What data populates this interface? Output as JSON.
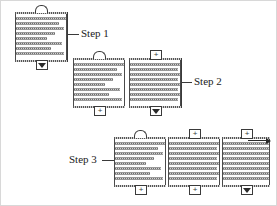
{
  "diagram": {
    "steps": [
      {
        "id": "step1",
        "label": "Step 1",
        "units": 1
      },
      {
        "id": "step2",
        "label": "Step 2",
        "units": 2
      },
      {
        "id": "step3",
        "label": "Step 3",
        "units": 3
      }
    ],
    "glyph_names": {
      "arch": "arch-connector-icon",
      "boxplus": "plus-connector-icon",
      "triangle": "triangle-terminator-icon"
    },
    "glyph_text": {
      "plus": "+",
      "arch": "",
      "triangle": ""
    },
    "colors": {
      "line": "#4a4a4a",
      "bar_dark": "#6e6e6e",
      "bar_light": "#d5d5d5",
      "text": "#1b1b1b",
      "background": "#ffffff",
      "frame": "#d8d8d8"
    },
    "units": [
      {
        "id": "s1-u1",
        "step": "Step 1",
        "position": {
          "x": 14,
          "y": 11,
          "w": 52,
          "h": 50
        },
        "top_glyph": "arch",
        "bottom_glyph": "triangle",
        "bar_lengths": [
          100,
          86,
          96,
          78,
          62,
          92,
          70,
          96,
          84
        ]
      },
      {
        "id": "s2-u1",
        "step": "Step 2",
        "position": {
          "x": 72,
          "y": 57,
          "w": 52,
          "h": 50
        },
        "top_glyph": "arch",
        "bottom_glyph": "boxplus",
        "bar_lengths": [
          100,
          86,
          96,
          78,
          62,
          92,
          70,
          96,
          84
        ]
      },
      {
        "id": "s2-u2",
        "step": "Step 2",
        "position": {
          "x": 128,
          "y": 57,
          "w": 52,
          "h": 50
        },
        "top_glyph": "boxplus",
        "bottom_glyph": "triangle",
        "bar_lengths": [
          100,
          96,
          100,
          96,
          100,
          96,
          100,
          96,
          100
        ]
      },
      {
        "id": "s3-u1",
        "step": "Step 3",
        "position": {
          "x": 113,
          "y": 136,
          "w": 52,
          "h": 50
        },
        "top_glyph": "arch",
        "bottom_glyph": "boxplus",
        "bar_lengths": [
          100,
          86,
          96,
          78,
          62,
          92,
          70,
          96,
          84
        ]
      },
      {
        "id": "s3-u2",
        "step": "Step 3",
        "position": {
          "x": 167,
          "y": 136,
          "w": 52,
          "h": 50
        },
        "top_glyph": "boxplus",
        "bottom_glyph": "boxplus",
        "bar_lengths": [
          100,
          96,
          100,
          96,
          100,
          96,
          100,
          96,
          100
        ]
      },
      {
        "id": "s3-u3",
        "step": "Step 3",
        "position": {
          "x": 221,
          "y": 136,
          "w": 48,
          "h": 50
        },
        "top_glyph": "boxplus",
        "bottom_glyph": "triangle",
        "bar_lengths": [
          100,
          100,
          100,
          100,
          100,
          100,
          100,
          100,
          100
        ]
      }
    ],
    "callouts": [
      {
        "id": "callout-step1",
        "label": "Step 1",
        "text_x": 80,
        "text_y": 26,
        "leader_x": 66,
        "leader_y": 32,
        "leader_w": 12,
        "bracket_x": 66,
        "bracket_y": 11,
        "bracket_h": 50
      },
      {
        "id": "callout-step2",
        "label": "Step 2",
        "text_x": 192,
        "text_y": 74,
        "leader_x": 180,
        "leader_y": 80,
        "leader_w": 11,
        "bracket_x": 180,
        "bracket_y": 57,
        "bracket_h": 50
      },
      {
        "id": "callout-step3",
        "label": "Step 3",
        "text_x": 68,
        "text_y": 152,
        "leader_x": 101,
        "leader_y": 158,
        "leader_w": 12,
        "bracket_x": 0,
        "bracket_y": 0,
        "bracket_h": 0
      }
    ],
    "output_arrow": {
      "id": "output-arrow",
      "x": 246,
      "y": 139,
      "w": 22
    }
  }
}
